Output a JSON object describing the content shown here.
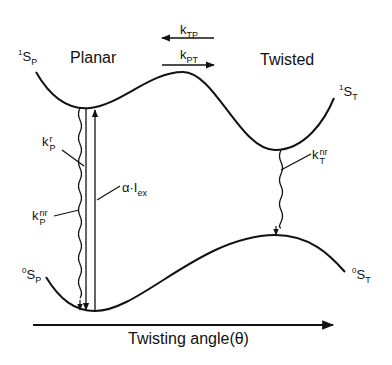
{
  "diagram": {
    "regions": {
      "planar": "Planar",
      "twisted": "Twisted"
    },
    "states": {
      "s1_planar": {
        "base": "S",
        "pre": "1",
        "sub": "P"
      },
      "s1_twisted": {
        "base": "S",
        "pre": "1",
        "sub": "T"
      },
      "s0_planar": {
        "base": "S",
        "pre": "0",
        "sub": "P"
      },
      "s0_twisted": {
        "base": "S",
        "pre": "0",
        "sub": "T"
      }
    },
    "rates": {
      "k_tp": {
        "base": "k",
        "sub": "TP",
        "direction": "left"
      },
      "k_pt": {
        "base": "k",
        "sub": "PT",
        "direction": "right"
      },
      "k_p_r": {
        "base": "k",
        "sup": "r",
        "sub": "P"
      },
      "k_p_nr": {
        "base": "k",
        "sup": "nr",
        "sub": "P"
      },
      "k_t_nr": {
        "base": "k",
        "sup": "nr",
        "sub": "T"
      }
    },
    "excitation": {
      "prefix": "α·I",
      "sub": "ex"
    },
    "axis": {
      "label": "Twisting angle(θ)"
    },
    "colors": {
      "stroke": "#111111",
      "background": "#ffffff"
    }
  }
}
